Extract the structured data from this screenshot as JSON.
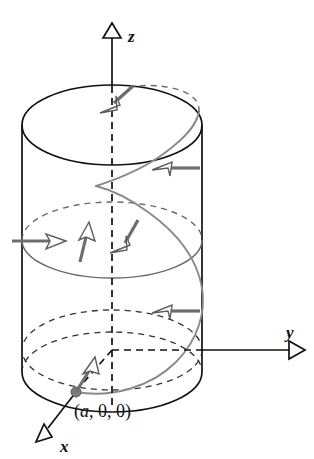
{
  "figure": {
    "background_color": "#ffffff",
    "width": 314,
    "height": 459
  },
  "axes": {
    "z": {
      "label": "z",
      "arrow": "up",
      "arrowhead": "hollow-triangle",
      "label_x": 128,
      "label_y": 42
    },
    "y": {
      "label": "y",
      "arrow": "right",
      "arrowhead": "hollow-triangle",
      "label_x": 288,
      "label_y": 336
    },
    "x": {
      "label": "x",
      "arrow": "down-left",
      "arrowhead": "hollow-triangle",
      "label_x": 62,
      "label_y": 452
    }
  },
  "annotations": {
    "point_label": "(a, 0, 0)",
    "point_label_open": "(",
    "point_label_a": "a",
    "point_label_rest": ", 0, 0)",
    "point_label_x": 74,
    "point_label_y": 415
  },
  "colors": {
    "axis": "#111111",
    "cylinder_outline": "#111111",
    "hidden_edge": "#333333",
    "helix": "#8a8a8a",
    "vector_shaft": "#6e6e6e",
    "vector_head_fill": "#ffffff",
    "vector_head_stroke": "#5d5d5d",
    "mid_circle": "#6b6b6b",
    "point_dot": "#7a7a7a"
  },
  "geometry": {
    "cylinder_center_x": 112,
    "cylinder_radius_x": 90,
    "ellipse_radius_y": 40,
    "top_ellipse_center_y": 125,
    "origin_y": 350,
    "bottom_arc_center_y": 372,
    "mid_ellipse_center_y": 240
  },
  "vectors": [
    {
      "name": "tangent-vector-top",
      "tail_x": 132,
      "tail_y": 88,
      "tip_x": 107,
      "tip_y": 110
    },
    {
      "name": "tangent-vector-upper-right",
      "tail_x": 196,
      "tail_y": 168,
      "tip_x": 157,
      "tip_y": 168
    },
    {
      "name": "tangent-vector-mid-left",
      "tail_x": 14,
      "tail_y": 242,
      "tip_x": 61,
      "tip_y": 242
    },
    {
      "name": "tangent-vector-mid-center",
      "tail_x": 81,
      "tail_y": 259,
      "tip_x": 89,
      "tip_y": 227
    },
    {
      "name": "tangent-vector-mid-right",
      "tail_x": 137,
      "tail_y": 223,
      "tip_x": 118,
      "tip_y": 250
    },
    {
      "name": "tangent-vector-lower-right",
      "tail_x": 197,
      "tail_y": 311,
      "tip_x": 155,
      "tip_y": 311
    },
    {
      "name": "tangent-vector-base",
      "tail_x": 76,
      "tail_y": 392,
      "tip_x": 93,
      "tip_y": 362
    }
  ]
}
